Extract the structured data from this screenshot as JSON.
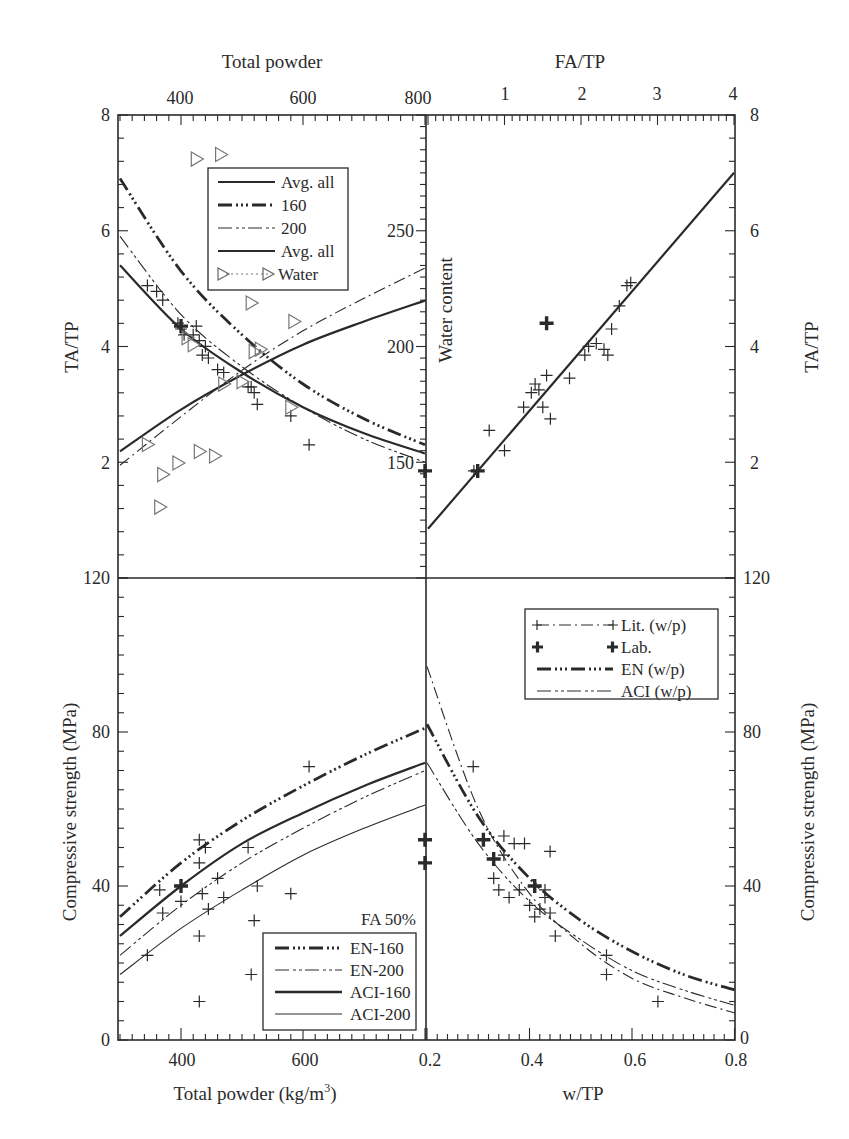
{
  "chart_data": [
    {
      "panel": "top-left",
      "type": "line",
      "title": "",
      "xlabel": "Total powder",
      "x_axis_position": "top",
      "ylabel": "TA/TP",
      "secondary_ylabel": "Water content",
      "xlim": [
        300,
        800
      ],
      "xticks": [
        400,
        600,
        800
      ],
      "ylim": [
        0,
        8
      ],
      "yticks": [
        2,
        4,
        6,
        8
      ],
      "secondary_ylim": [
        100,
        300
      ],
      "secondary_yticks": [
        150,
        200,
        250
      ],
      "legend": [
        "Avg. all",
        "160",
        "200",
        "Avg. all",
        "Water"
      ],
      "series": [
        {
          "name": "Avg. all (TA/TP)",
          "style": "solid-bold",
          "x": [
            300,
            400,
            500,
            600,
            700,
            800
          ],
          "y": [
            5.4,
            4.3,
            3.55,
            2.95,
            2.5,
            2.15
          ]
        },
        {
          "name": "160 (TA/TP)",
          "style": "dash-dot-dot-bold",
          "x": [
            300,
            400,
            500,
            600,
            700,
            800
          ],
          "y": [
            6.9,
            5.3,
            4.2,
            3.35,
            2.75,
            2.3
          ]
        },
        {
          "name": "200 (TA/TP)",
          "style": "dash-dot-dot-thin",
          "x": [
            300,
            400,
            500,
            600,
            700,
            800
          ],
          "y": [
            5.9,
            4.55,
            3.65,
            2.95,
            2.4,
            2.0
          ]
        },
        {
          "name": "Avg. all (Water content)",
          "style": "solid-bold",
          "axis": "secondary",
          "x": [
            300,
            400,
            500,
            600,
            700,
            800
          ],
          "y": [
            155,
            173,
            188,
            201,
            211,
            220
          ]
        },
        {
          "name": "Water fit (Water content)",
          "style": "dash-dot-thin",
          "axis": "secondary",
          "x": [
            300,
            400,
            500,
            600,
            700,
            800
          ],
          "y": [
            149,
            170,
            190,
            207,
            221,
            234
          ]
        },
        {
          "name": "Lit. points (TA/TP)",
          "style": "plus",
          "x": [
            345,
            360,
            370,
            395,
            400,
            405,
            420,
            425,
            430,
            435,
            440,
            445,
            460,
            470,
            510,
            515,
            520,
            525,
            580,
            610
          ],
          "y": [
            5.05,
            4.95,
            4.8,
            4.4,
            4.3,
            4.2,
            4.2,
            4.35,
            4.1,
            3.85,
            4.0,
            3.8,
            3.6,
            3.55,
            3.3,
            3.3,
            3.2,
            3.0,
            2.8,
            2.3
          ]
        },
        {
          "name": "Lab. (TA/TP)",
          "style": "bold-plus",
          "x": [
            400,
            800
          ],
          "y": [
            4.35,
            1.85
          ]
        },
        {
          "name": "Water (points)",
          "style": "triangle",
          "axis": "secondary",
          "x": [
            345,
            365,
            370,
            395,
            410,
            420,
            425,
            430,
            455,
            465,
            470,
            500,
            515,
            520,
            530,
            580,
            585
          ],
          "y": [
            158,
            131,
            145,
            150,
            204,
            201,
            281,
            155,
            153,
            283,
            184,
            185,
            219,
            198,
            199,
            174,
            211
          ]
        }
      ]
    },
    {
      "panel": "top-right",
      "type": "scatter",
      "xlabel": "FA/TP",
      "x_axis_position": "top",
      "ylabel": "TA/TP",
      "xlim": [
        0,
        4
      ],
      "xticks": [
        1,
        2,
        3,
        4
      ],
      "ylim": [
        0,
        8
      ],
      "yticks": [
        2,
        4,
        6,
        8
      ],
      "series": [
        {
          "name": "Fit line",
          "style": "solid-bold",
          "x": [
            0,
            4
          ],
          "y": [
            0.85,
            7.0
          ]
        },
        {
          "name": "Lit. points",
          "style": "plus",
          "x": [
            0.6,
            0.8,
            1.0,
            1.25,
            1.35,
            1.4,
            1.45,
            1.5,
            1.55,
            1.6,
            1.85,
            2.05,
            2.1,
            2.2,
            2.3,
            2.35,
            2.4,
            2.5,
            2.6,
            2.65
          ],
          "y": [
            1.85,
            2.55,
            2.2,
            2.95,
            3.2,
            3.35,
            3.25,
            2.95,
            3.5,
            2.75,
            3.45,
            3.85,
            4.0,
            4.05,
            3.95,
            3.85,
            4.3,
            4.7,
            5.05,
            5.1
          ]
        },
        {
          "name": "Lab.",
          "style": "bold-plus",
          "x": [
            0.65,
            1.55
          ],
          "y": [
            1.85,
            4.4
          ]
        }
      ]
    },
    {
      "panel": "bottom-left",
      "type": "line",
      "xlabel": "Total powder (kg/m³)",
      "ylabel": "Compressive strength (MPa)",
      "xlim": [
        300,
        800
      ],
      "xticks": [
        400,
        600
      ],
      "ylim": [
        0,
        120
      ],
      "yticks": [
        0,
        40,
        80,
        120
      ],
      "annotation": "FA 50%",
      "legend": [
        "EN-160",
        "EN-200",
        "ACI-160",
        "ACI-200"
      ],
      "series": [
        {
          "name": "EN-160",
          "style": "dash-dot-dot-bold",
          "x": [
            300,
            400,
            500,
            600,
            700,
            800
          ],
          "y": [
            32,
            46,
            57,
            66,
            74,
            81
          ]
        },
        {
          "name": "EN-200",
          "style": "dash-dot-dot-thin",
          "x": [
            300,
            400,
            500,
            600,
            700,
            800
          ],
          "y": [
            22,
            35,
            46,
            55,
            63,
            70
          ]
        },
        {
          "name": "ACI-160",
          "style": "solid-bold",
          "x": [
            300,
            400,
            500,
            600,
            700,
            800
          ],
          "y": [
            27,
            40,
            51,
            59,
            66,
            72
          ]
        },
        {
          "name": "ACI-200",
          "style": "solid-thin",
          "x": [
            300,
            400,
            500,
            600,
            700,
            800
          ],
          "y": [
            17,
            29,
            39,
            48,
            55,
            61
          ]
        },
        {
          "name": "Lit. points",
          "style": "plus",
          "x": [
            345,
            365,
            370,
            400,
            430,
            430,
            435,
            440,
            445,
            460,
            470,
            510,
            515,
            520,
            525,
            580,
            610,
            430,
            430
          ],
          "y": [
            22,
            39,
            33,
            36,
            52,
            46,
            38,
            50,
            34,
            42,
            37,
            50,
            17,
            31,
            40,
            38,
            71,
            27,
            10
          ]
        },
        {
          "name": "Lab.",
          "style": "bold-plus",
          "x": [
            400,
            800,
            800
          ],
          "y": [
            40,
            52,
            46
          ]
        }
      ]
    },
    {
      "panel": "bottom-right",
      "type": "line",
      "xlabel": "w/TP",
      "ylabel": "Compressive strength (MPa)",
      "xlim": [
        0.2,
        0.8
      ],
      "xticks": [
        0.2,
        0.4,
        0.6,
        0.8
      ],
      "ylim": [
        0,
        120
      ],
      "yticks": [
        0,
        40,
        80,
        120
      ],
      "legend": [
        "Lit. (w/p)",
        "Lab.",
        "EN (w/p)",
        "ACI (w/p)"
      ],
      "series": [
        {
          "name": "Lit. (w/p)",
          "style": "dash-dot-thin",
          "x": [
            0.2,
            0.3,
            0.4,
            0.5,
            0.6,
            0.7,
            0.8
          ],
          "y": [
            97,
            60,
            38,
            25,
            16,
            11,
            7
          ]
        },
        {
          "name": "EN (w/p)",
          "style": "dash-dot-dot-bold",
          "x": [
            0.2,
            0.3,
            0.4,
            0.5,
            0.6,
            0.7,
            0.8
          ],
          "y": [
            82,
            58,
            42,
            31,
            23,
            17,
            13
          ]
        },
        {
          "name": "ACI (w/p)",
          "style": "dash-dot-dot-thin",
          "x": [
            0.2,
            0.3,
            0.4,
            0.5,
            0.6,
            0.7,
            0.8
          ],
          "y": [
            72,
            51,
            36,
            26,
            18,
            13,
            9
          ]
        },
        {
          "name": "Lit. points",
          "style": "plus",
          "x": [
            0.29,
            0.33,
            0.34,
            0.35,
            0.35,
            0.36,
            0.37,
            0.38,
            0.39,
            0.4,
            0.41,
            0.42,
            0.43,
            0.43,
            0.44,
            0.44,
            0.45,
            0.55,
            0.55,
            0.65
          ],
          "y": [
            71,
            42,
            39,
            53,
            48,
            37,
            51,
            39,
            51,
            35,
            32,
            34,
            37,
            39,
            33,
            49,
            27,
            22,
            17,
            10
          ]
        },
        {
          "name": "Lab.",
          "style": "bold-plus",
          "x": [
            0.31,
            0.33,
            0.41
          ],
          "y": [
            52,
            47,
            40
          ]
        }
      ]
    }
  ],
  "labels": {
    "top_left_xlabel": "Total powder",
    "top_right_xlabel": "FA/TP",
    "left_top_ylabel": "TA/TP",
    "right_top_ylabel": "TA/TP",
    "inner_ylabel": "Water content",
    "left_bottom_ylabel": "Compressive strength (MPa)",
    "right_bottom_ylabel": "Compressive strength (MPa)",
    "bottom_left_xlabel": "Total powder (kg/m",
    "bottom_left_xlabel_sup": "3",
    "bottom_left_xlabel_end": ")",
    "bottom_right_xlabel": "w/TP",
    "annotation_fa": "FA 50%"
  },
  "legends": {
    "top": [
      "Avg. all",
      "160",
      "200",
      "Avg. all",
      "Water"
    ],
    "bottom_left": [
      "EN-160",
      "EN-200",
      "ACI-160",
      "ACI-200"
    ],
    "bottom_right": [
      "Lit. (w/p)",
      "Lab.",
      "EN (w/p)",
      "ACI (w/p)"
    ]
  },
  "ticks": {
    "top_left_x": [
      "400",
      "600",
      "800"
    ],
    "top_right_x": [
      "1",
      "2",
      "3",
      "4"
    ],
    "left_top_y": [
      "8",
      "6",
      "4",
      "2"
    ],
    "right_top_y": [
      "8",
      "6",
      "4",
      "2"
    ],
    "inner_y": [
      "250",
      "200",
      "150"
    ],
    "left_bottom_y": [
      "120",
      "80",
      "40",
      "0"
    ],
    "right_bottom_y": [
      "120",
      "80",
      "40",
      "0"
    ],
    "bottom_left_x": [
      "400",
      "600"
    ],
    "bottom_right_x": [
      "0.2",
      "0.4",
      "0.6",
      "0.8"
    ]
  },
  "colors": {
    "ink": "#2a2a2a",
    "triangle": "#777777",
    "background": "#ffffff"
  }
}
